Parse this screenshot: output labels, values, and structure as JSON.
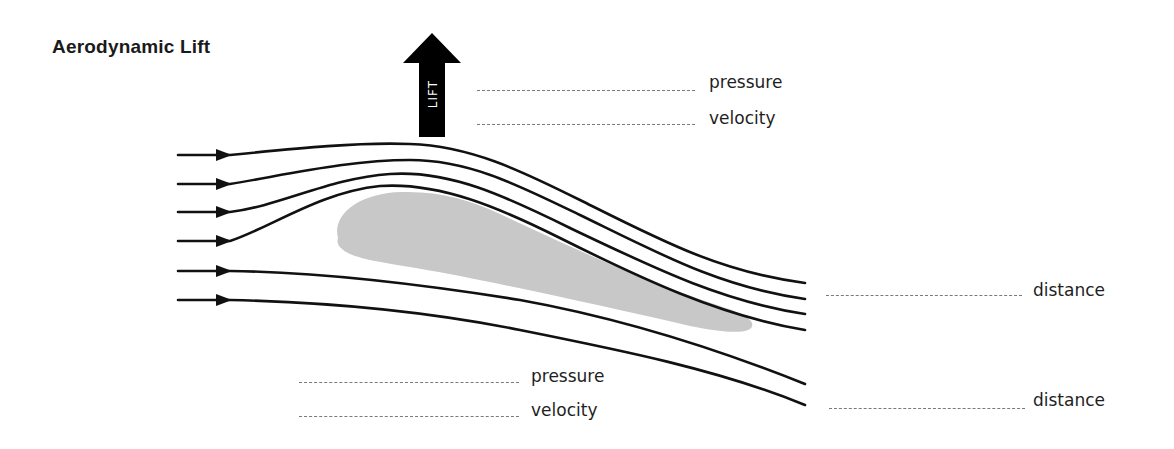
{
  "title": "Aerodynamic Lift",
  "lift_arrow": {
    "label": "LIFT",
    "color": "#000000",
    "direction": "up"
  },
  "airfoil": {
    "color": "#c8c8c8"
  },
  "streamlines": {
    "count": 6,
    "color": "#111111",
    "arrow-icon": "arrow-right"
  },
  "top_labels": [
    {
      "text": "pressure"
    },
    {
      "text": "velocity"
    }
  ],
  "bottom_labels": [
    {
      "text": "pressure"
    },
    {
      "text": "velocity"
    }
  ],
  "right_labels": [
    {
      "text": "distance"
    },
    {
      "text": "distance"
    }
  ]
}
